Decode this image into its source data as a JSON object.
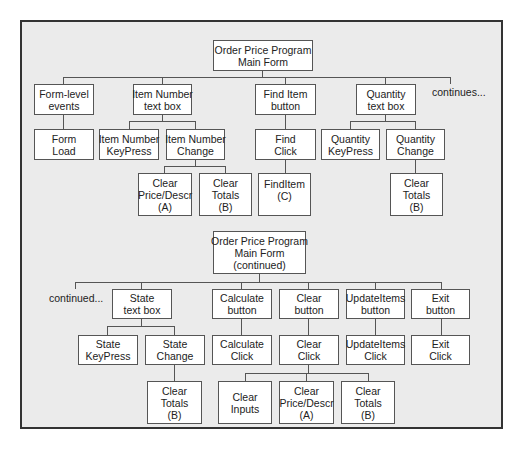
{
  "diagram": {
    "top_chart": {
      "root": {
        "lines": [
          "Order Price Program",
          "Main Form"
        ]
      },
      "level1": [
        {
          "id": "form-level-events",
          "lines": [
            "Form-level",
            "events"
          ]
        },
        {
          "id": "item-number-text-box",
          "lines": [
            "Item Number",
            "text box"
          ]
        },
        {
          "id": "find-item-button",
          "lines": [
            "Find Item",
            "button"
          ]
        },
        {
          "id": "quantity-text-box",
          "lines": [
            "Quantity",
            "text box"
          ]
        }
      ],
      "continues_label": "continues...",
      "level2": [
        {
          "id": "form-load",
          "parent": "form-level-events",
          "lines": [
            "Form",
            "Load"
          ]
        },
        {
          "id": "item-number-keypress",
          "parent": "item-number-text-box",
          "lines": [
            "Item Number",
            "KeyPress"
          ]
        },
        {
          "id": "item-number-change",
          "parent": "item-number-text-box",
          "lines": [
            "Item Number",
            "Change"
          ]
        },
        {
          "id": "find-click",
          "parent": "find-item-button",
          "lines": [
            "Find",
            "Click"
          ]
        },
        {
          "id": "quantity-keypress",
          "parent": "quantity-text-box",
          "lines": [
            "Quantity",
            "KeyPress"
          ]
        },
        {
          "id": "quantity-change",
          "parent": "quantity-text-box",
          "lines": [
            "Quantity",
            "Change"
          ]
        }
      ],
      "level3": [
        {
          "id": "clear-price-descr-a",
          "parent": "item-number-change",
          "lines": [
            "Clear",
            "Price/Descr",
            "(A)"
          ]
        },
        {
          "id": "clear-totals-b-1",
          "parent": "item-number-change",
          "lines": [
            "Clear",
            "Totals",
            "(B)"
          ]
        },
        {
          "id": "finditem-c",
          "parent": "find-click",
          "lines": [
            "FindItem",
            "(C)"
          ]
        },
        {
          "id": "clear-totals-b-2",
          "parent": "quantity-change",
          "lines": [
            "Clear",
            "Totals",
            "(B)"
          ]
        }
      ]
    },
    "bottom_chart": {
      "root": {
        "lines": [
          "Order Price Program",
          "Main Form",
          "(continued)"
        ]
      },
      "continued_label": "continued...",
      "level1": [
        {
          "id": "state-text-box",
          "lines": [
            "State",
            "text box"
          ]
        },
        {
          "id": "calculate-button",
          "lines": [
            "Calculate",
            "button"
          ]
        },
        {
          "id": "clear-button",
          "lines": [
            "Clear",
            "button"
          ]
        },
        {
          "id": "updateitems-button",
          "lines": [
            "UpdateItems",
            "button"
          ]
        },
        {
          "id": "exit-button",
          "lines": [
            "Exit",
            "button"
          ]
        }
      ],
      "level2": [
        {
          "id": "state-keypress",
          "parent": "state-text-box",
          "lines": [
            "State",
            "KeyPress"
          ]
        },
        {
          "id": "state-change",
          "parent": "state-text-box",
          "lines": [
            "State",
            "Change"
          ]
        },
        {
          "id": "calculate-click",
          "parent": "calculate-button",
          "lines": [
            "Calculate",
            "Click"
          ]
        },
        {
          "id": "clear-click",
          "parent": "clear-button",
          "lines": [
            "Clear",
            "Click"
          ]
        },
        {
          "id": "updateitems-click",
          "parent": "updateitems-button",
          "lines": [
            "UpdateItems",
            "Click"
          ]
        },
        {
          "id": "exit-click",
          "parent": "exit-button",
          "lines": [
            "Exit",
            "Click"
          ]
        }
      ],
      "level3": [
        {
          "id": "clear-totals-b-3",
          "parent": "state-change",
          "lines": [
            "Clear",
            "Totals",
            "(B)"
          ]
        },
        {
          "id": "clear-inputs",
          "parent": "clear-click",
          "lines": [
            "Clear",
            "Inputs"
          ]
        },
        {
          "id": "clear-price-descr-a-2",
          "parent": "clear-click",
          "lines": [
            "Clear",
            "Price/Descr",
            "(A)"
          ]
        },
        {
          "id": "clear-totals-b-4",
          "parent": "clear-click",
          "lines": [
            "Clear",
            "Totals",
            "(B)"
          ]
        }
      ]
    },
    "colors": {
      "frame_background": "#ebebeb",
      "frame_border": "#333333",
      "box_background": "#ffffff",
      "box_border": "#555555",
      "text": "#222222"
    }
  }
}
